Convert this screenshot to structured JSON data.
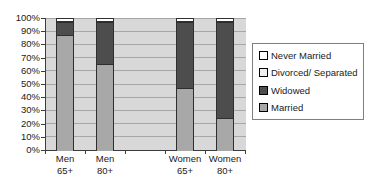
{
  "chart_data": {
    "type": "bar",
    "subtype": "stacked-100-percent-column",
    "title": "",
    "xlabel": "",
    "ylabel": "",
    "ylim": [
      0,
      100
    ],
    "grid": true,
    "plot_bg": "#d8d8d8",
    "grid_color": "#a6a6a6",
    "categories": [
      {
        "line1": "Men",
        "line2": "65+"
      },
      {
        "line1": "Men",
        "line2": "80+"
      },
      {
        "line1": "",
        "line2": ""
      },
      {
        "line1": "Women",
        "line2": "65+"
      },
      {
        "line1": "Women",
        "line2": "80+"
      }
    ],
    "series": [
      {
        "name": "Married",
        "color": "#a8a8a8",
        "values": [
          87,
          65,
          null,
          47,
          24
        ]
      },
      {
        "name": "Widowed",
        "color": "#4d4d4d",
        "values": [
          10,
          32,
          null,
          50,
          73
        ]
      },
      {
        "name": "Divorced/ Separated",
        "color": "#efefef",
        "values": [
          1,
          1,
          null,
          1,
          1
        ]
      },
      {
        "name": "Never Married",
        "color": "#ffffff",
        "values": [
          2,
          2,
          null,
          2,
          2
        ]
      }
    ],
    "yticks": [
      "100%",
      "90%",
      "80%",
      "70%",
      "60%",
      "50%",
      "40%",
      "30%",
      "20%",
      "10%",
      "0%"
    ],
    "legend": {
      "position": "right",
      "entries": [
        "Never Married",
        "Divorced/ Separated",
        "Widowed",
        "Married"
      ]
    }
  }
}
